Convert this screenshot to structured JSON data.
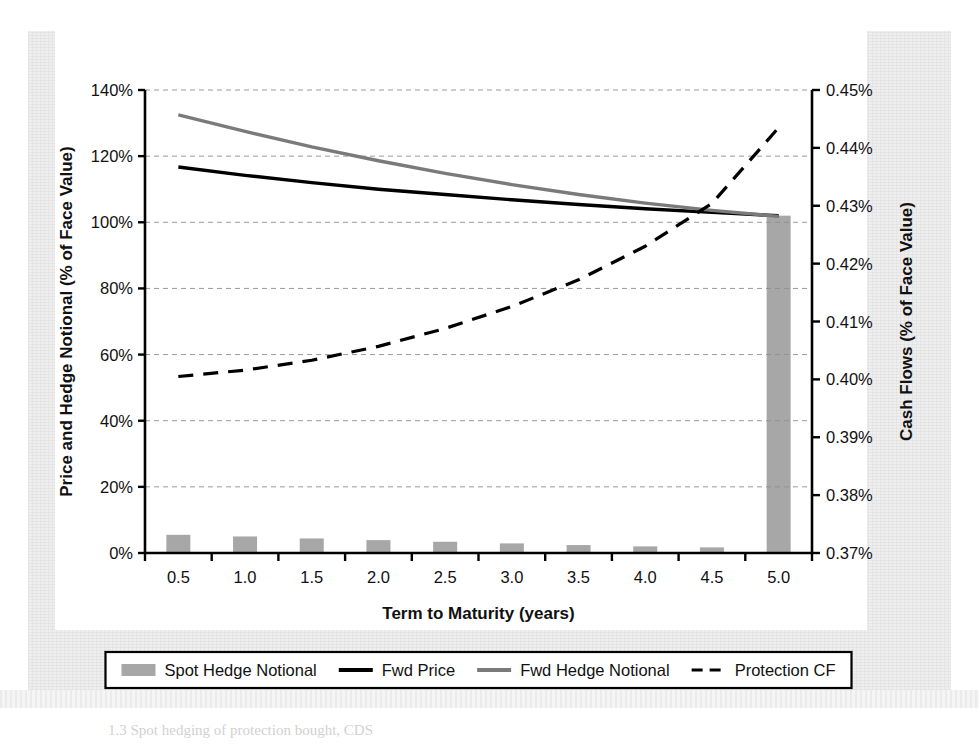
{
  "figure": {
    "caption": "1.3 Spot hedging of protection bought, CDS",
    "frame_background": "#eeeeee",
    "plot_background": "#ffffff"
  },
  "chart_data": {
    "type": "bar",
    "title": "",
    "xlabel": "Term to Maturity (years)",
    "ylabel": "Price and Hedge Notional (% of Face Value)",
    "y2label": "Cash Flows (% of Face Value)",
    "grid": true,
    "legend_position": "bottom",
    "categories": [
      "0.5",
      "1.0",
      "1.5",
      "2.0",
      "2.5",
      "3.0",
      "3.5",
      "4.0",
      "4.5",
      "5.0"
    ],
    "x": [
      0.5,
      1.0,
      1.5,
      2.0,
      2.5,
      3.0,
      3.5,
      4.0,
      4.5,
      5.0
    ],
    "ylim": [
      0,
      140
    ],
    "yticks": [
      0,
      20,
      40,
      60,
      80,
      100,
      120,
      140
    ],
    "ytick_labels": [
      "0%",
      "20%",
      "40%",
      "60%",
      "80%",
      "100%",
      "120%",
      "140%"
    ],
    "y2lim": [
      0.37,
      0.45
    ],
    "y2ticks": [
      0.37,
      0.38,
      0.39,
      0.4,
      0.41,
      0.42,
      0.43,
      0.44,
      0.45
    ],
    "y2tick_labels": [
      "0.37%",
      "0.38%",
      "0.39%",
      "0.40%",
      "0.41%",
      "0.42%",
      "0.43%",
      "0.44%",
      "0.45%"
    ],
    "series": [
      {
        "name": "Spot Hedge Notional",
        "kind": "bar",
        "axis": "left",
        "color": "#8e8e8e",
        "values": [
          5.5,
          5.0,
          4.4,
          3.9,
          3.4,
          2.9,
          2.4,
          2.0,
          1.7,
          102.0
        ]
      },
      {
        "name": "Fwd Price",
        "kind": "line",
        "axis": "left",
        "color": "#000000",
        "style": "solid",
        "values": [
          116.7,
          114.2,
          112.0,
          110.0,
          108.4,
          106.8,
          105.4,
          104.1,
          103.0,
          102.0
        ]
      },
      {
        "name": "Fwd Hedge Notional",
        "kind": "line",
        "axis": "left",
        "color": "#7a7a7a",
        "style": "solid",
        "values": [
          132.5,
          127.5,
          122.8,
          118.6,
          114.8,
          111.4,
          108.4,
          105.8,
          103.6,
          101.8
        ]
      },
      {
        "name": "Protection CF",
        "kind": "line",
        "axis": "right",
        "color": "#000000",
        "style": "dashed",
        "values": [
          0.4005,
          0.4016,
          0.4033,
          0.4057,
          0.4088,
          0.4126,
          0.4172,
          0.423,
          0.4304,
          0.4435
        ]
      }
    ]
  },
  "legend": {
    "items": [
      {
        "label": "Spot Hedge Notional",
        "marker": "bar-swatch",
        "color": "#8e8e8e"
      },
      {
        "label": "Fwd Price",
        "marker": "solid-line",
        "color": "#000000"
      },
      {
        "label": "Fwd Hedge Notional",
        "marker": "solid-line",
        "color": "#7a7a7a"
      },
      {
        "label": "Protection CF",
        "marker": "dashed-line",
        "color": "#000000"
      }
    ]
  }
}
